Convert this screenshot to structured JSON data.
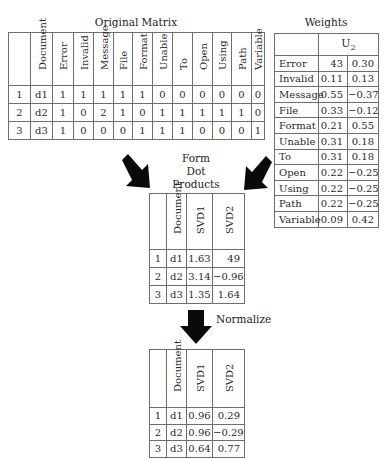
{
  "original_matrix": {
    "title": "Original Matrix",
    "headers": [
      "",
      "Document",
      "Error",
      "Invalid",
      "Message",
      "File",
      "Format",
      "Unable",
      "To",
      "Open",
      "Using",
      "Path",
      "Variable"
    ],
    "rows": [
      [
        "1",
        "d1",
        "1",
        "1",
        "1",
        "1",
        "1",
        "0",
        "0",
        "0",
        "0",
        "0",
        "0"
      ],
      [
        "2",
        "d2",
        "1",
        "0",
        "2",
        "1",
        "0",
        "1",
        "1",
        "1",
        "1",
        "1",
        "0"
      ],
      [
        "3",
        "d3",
        "1",
        "0",
        "0",
        "0",
        "1",
        "1",
        "1",
        "0",
        "0",
        "0",
        "1"
      ]
    ]
  },
  "weights": {
    "title": "Weights",
    "header": "U",
    "header_sub": "2",
    "rows": [
      [
        "Error",
        "43",
        "0.30"
      ],
      [
        "Invalid",
        "0.11",
        "0.13"
      ],
      [
        "Message",
        "0.55",
        "−0.37"
      ],
      [
        "File",
        "0.33",
        "−0.12"
      ],
      [
        "Format",
        "0.21",
        "0.55"
      ],
      [
        "Unable",
        "0.31",
        "0.18"
      ],
      [
        "To",
        "0.31",
        "0.18"
      ],
      [
        "Open",
        "0.22",
        "−0.25"
      ],
      [
        "Using",
        "0.22",
        "−0.25"
      ],
      [
        "Path",
        "0.22",
        "−0.25"
      ],
      [
        "Variable",
        "0.09",
        "0.42"
      ]
    ]
  },
  "dot_products": {
    "label_lines": [
      "Form",
      "Dot",
      "Products"
    ],
    "headers": [
      "",
      "Document",
      "SVD1",
      "SVD2"
    ],
    "rows": [
      [
        "1",
        "d1",
        "1.63",
        "49"
      ],
      [
        "2",
        "d2",
        "3.14",
        "−0.96"
      ],
      [
        "3",
        "d3",
        "1.35",
        "1.64"
      ]
    ]
  },
  "normalize": {
    "label": "Normalize"
  },
  "normalized": {
    "headers": [
      "",
      "Document",
      "SVD1",
      "SVD2"
    ],
    "rows": [
      [
        "1",
        "d1",
        "0.96",
        "0.29"
      ],
      [
        "2",
        "d2",
        "0.96",
        "−0.29"
      ],
      [
        "3",
        "d3",
        "0.64",
        "0.77"
      ]
    ]
  },
  "icons": {
    "arrow_left": "arrow-down-right-icon",
    "arrow_right": "arrow-down-left-icon",
    "arrow_down": "arrow-down-icon"
  }
}
